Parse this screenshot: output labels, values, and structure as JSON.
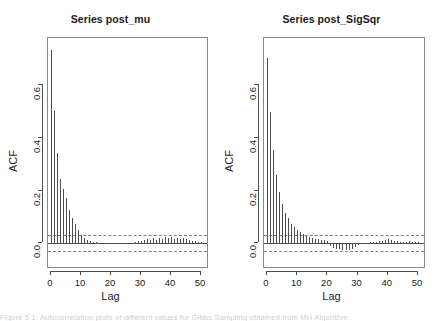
{
  "figure": {
    "width": 443,
    "height": 321,
    "background": "#ffffff",
    "line_color": "#4d4d4d",
    "ci_color": "#7a7aa8",
    "caption_partial": "Figure 5.1: Autocorrelation plots of different values for Gibbs Sampling obtained from MH Algorithm"
  },
  "chart_data": [
    {
      "type": "bar",
      "panel": "left",
      "title": "Series post_mu",
      "xlabel": "Lag",
      "ylabel": "ACF",
      "xlim": [
        -1,
        52
      ],
      "ylim": [
        -0.09,
        0.78
      ],
      "xticks": [
        0,
        10,
        20,
        30,
        40,
        50
      ],
      "yticks": [
        0.0,
        0.2,
        0.4,
        0.6
      ],
      "ytick_labels": [
        "0.0",
        "0.2",
        "0.4",
        "0.6"
      ],
      "grid": false,
      "legend": "none",
      "confidence_bounds": [
        0.031,
        -0.031
      ],
      "x": [
        0,
        1,
        2,
        3,
        4,
        5,
        6,
        7,
        8,
        9,
        10,
        11,
        12,
        13,
        14,
        15,
        16,
        17,
        18,
        19,
        20,
        21,
        22,
        23,
        24,
        25,
        26,
        27,
        28,
        29,
        30,
        31,
        32,
        33,
        34,
        35,
        36,
        37,
        38,
        39,
        40,
        41,
        42,
        43,
        44,
        45,
        46,
        47,
        48,
        49,
        50,
        51,
        52
      ],
      "values": [
        0.735,
        0.502,
        0.342,
        0.245,
        0.205,
        0.173,
        0.128,
        0.098,
        0.074,
        0.05,
        0.033,
        0.02,
        0.014,
        0.008,
        0.006,
        0.004,
        0.003,
        0.002,
        0.001,
        0.001,
        -0.002,
        -0.004,
        -0.003,
        -0.002,
        -0.003,
        -0.002,
        -0.001,
        0.002,
        0.004,
        0.008,
        0.01,
        0.014,
        0.018,
        0.012,
        0.02,
        0.014,
        0.021,
        0.016,
        0.023,
        0.019,
        0.024,
        0.017,
        0.022,
        0.018,
        0.02,
        0.016,
        0.013,
        0.01,
        0.008,
        0.006,
        0.004,
        0.002,
        0.001
      ]
    },
    {
      "type": "bar",
      "panel": "right",
      "title": "Series post_SigSqr",
      "xlabel": "Lag",
      "ylabel": "ACF",
      "xlim": [
        -1,
        52
      ],
      "ylim": [
        -0.09,
        0.78
      ],
      "xticks": [
        0,
        10,
        20,
        30,
        40,
        50
      ],
      "yticks": [
        0.0,
        0.2,
        0.4,
        0.6
      ],
      "ytick_labels": [
        "0.0",
        "0.2",
        "0.4",
        "0.6"
      ],
      "grid": false,
      "legend": "none",
      "confidence_bounds": [
        0.031,
        -0.031
      ],
      "x": [
        0,
        1,
        2,
        3,
        4,
        5,
        6,
        7,
        8,
        9,
        10,
        11,
        12,
        13,
        14,
        15,
        16,
        17,
        18,
        19,
        20,
        21,
        22,
        23,
        24,
        25,
        26,
        27,
        28,
        29,
        30,
        31,
        32,
        33,
        34,
        35,
        36,
        37,
        38,
        39,
        40,
        41,
        42,
        43,
        44,
        45,
        46,
        47,
        48,
        49,
        50,
        51,
        52
      ],
      "values": [
        0.705,
        0.498,
        0.355,
        0.26,
        0.196,
        0.15,
        0.117,
        0.095,
        0.074,
        0.062,
        0.052,
        0.043,
        0.035,
        0.029,
        0.024,
        0.021,
        0.018,
        0.016,
        0.013,
        0.011,
        0.008,
        -0.01,
        -0.016,
        -0.02,
        -0.022,
        -0.024,
        -0.026,
        -0.024,
        -0.02,
        -0.014,
        -0.008,
        -0.004,
        0.0,
        0.002,
        0.004,
        0.006,
        0.006,
        0.008,
        0.01,
        0.014,
        0.018,
        0.014,
        0.01,
        0.008,
        0.006,
        0.005,
        0.006,
        0.008,
        0.006,
        0.005,
        0.004,
        0.003,
        0.002
      ]
    }
  ]
}
